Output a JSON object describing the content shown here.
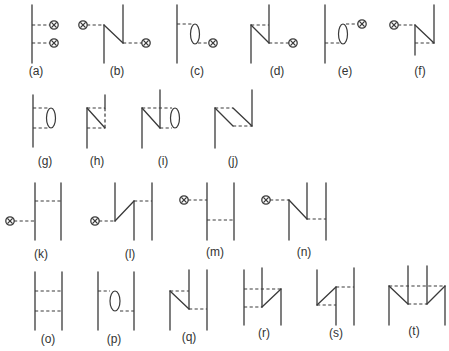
{
  "figure": {
    "diagrams": [
      {
        "id": "a",
        "label": "(a)",
        "lx": 36,
        "ly": 75,
        "solid": [
          [
            32,
            5,
            32,
            63
          ]
        ],
        "dash": [
          [
            32,
            25,
            50,
            25
          ],
          [
            32,
            43,
            50,
            43
          ]
        ],
        "loops": [],
        "crosses": [
          [
            54,
            25
          ],
          [
            54,
            43
          ]
        ]
      },
      {
        "id": "b",
        "label": "(b)",
        "lx": 117,
        "ly": 75,
        "solid": [
          [
            104,
            25,
            104,
            63
          ],
          [
            104,
            25,
            123,
            43
          ],
          [
            123,
            5,
            123,
            43
          ]
        ],
        "dash": [
          [
            87,
            25,
            104,
            25
          ],
          [
            123,
            43,
            142,
            43
          ]
        ],
        "loops": [],
        "crosses": [
          [
            83,
            25
          ],
          [
            146,
            43
          ]
        ]
      },
      {
        "id": "c",
        "label": "(c)",
        "lx": 197,
        "ly": 75,
        "solid": [
          [
            177,
            5,
            177,
            63
          ]
        ],
        "dash": [
          [
            177,
            24,
            192,
            24
          ],
          [
            198,
            43,
            209,
            43
          ]
        ],
        "loops": [
          [
            195,
            34,
            4.5,
            10
          ]
        ],
        "crosses": [
          [
            213,
            43
          ]
        ]
      },
      {
        "id": "d",
        "label": "(d)",
        "lx": 277,
        "ly": 75,
        "solid": [
          [
            251,
            25,
            251,
            63
          ],
          [
            251,
            25,
            269,
            43
          ],
          [
            269,
            5,
            269,
            43
          ]
        ],
        "dash": [
          [
            251,
            25,
            269,
            25
          ],
          [
            269,
            43,
            289,
            43
          ]
        ],
        "loops": [],
        "crosses": [
          [
            293,
            43
          ]
        ]
      },
      {
        "id": "e",
        "label": "(e)",
        "lx": 345,
        "ly": 75,
        "solid": [
          [
            325,
            5,
            325,
            63
          ]
        ],
        "dash": [
          [
            325,
            43,
            340,
            43
          ],
          [
            346,
            24,
            358,
            24
          ]
        ],
        "loops": [
          [
            343,
            34,
            4.5,
            10
          ]
        ],
        "crosses": [
          [
            362,
            24
          ]
        ]
      },
      {
        "id": "f",
        "label": "(f)",
        "lx": 420,
        "ly": 75,
        "solid": [
          [
            415,
            25,
            415,
            55
          ],
          [
            415,
            25,
            434,
            43
          ],
          [
            434,
            5,
            434,
            43
          ]
        ],
        "dash": [
          [
            398,
            25,
            415,
            25
          ],
          [
            415,
            43,
            434,
            43
          ]
        ],
        "loops": [],
        "crosses": [
          [
            394,
            25
          ]
        ]
      },
      {
        "id": "g",
        "label": "(g)",
        "lx": 45,
        "ly": 165,
        "solid": [
          [
            33,
            95,
            33,
            147
          ]
        ],
        "dash": [
          [
            33,
            108,
            48,
            108
          ],
          [
            33,
            128,
            48,
            128
          ]
        ],
        "loops": [
          [
            51,
            118,
            4.5,
            10
          ]
        ],
        "crosses": []
      },
      {
        "id": "h",
        "label": "(h)",
        "lx": 97,
        "ly": 165,
        "solid": [
          [
            87,
            108,
            87,
            148
          ],
          [
            87,
            108,
            105,
            128
          ],
          [
            105,
            95,
            105,
            108
          ]
        ],
        "dash": [
          [
            87,
            108,
            105,
            108
          ],
          [
            87,
            128,
            105,
            128
          ],
          [
            105,
            108,
            105,
            128
          ]
        ],
        "loops": [],
        "crosses": []
      },
      {
        "id": "i",
        "label": "(i)",
        "lx": 163,
        "ly": 165,
        "solid": [
          [
            142,
            108,
            142,
            148
          ],
          [
            142,
            108,
            160,
            128
          ],
          [
            160,
            90,
            160,
            128
          ]
        ],
        "dash": [
          [
            142,
            108,
            172,
            108
          ],
          [
            160,
            128,
            172,
            128
          ]
        ],
        "loops": [
          [
            175,
            118,
            4.5,
            10
          ]
        ],
        "crosses": []
      },
      {
        "id": "j",
        "label": "(j)",
        "lx": 233,
        "ly": 165,
        "solid": [
          [
            215,
            108,
            215,
            148
          ],
          [
            215,
            108,
            233,
            126
          ],
          [
            233,
            108,
            252,
            126
          ],
          [
            252,
            90,
            252,
            126
          ]
        ],
        "dash": [
          [
            215,
            108,
            233,
            108
          ],
          [
            233,
            126,
            252,
            126
          ]
        ],
        "loops": [],
        "crosses": []
      },
      {
        "id": "k",
        "label": "(k)",
        "lx": 41,
        "ly": 258,
        "solid": [
          [
            35,
            183,
            35,
            240
          ],
          [
            61,
            183,
            61,
            240
          ]
        ],
        "dash": [
          [
            14,
            221,
            35,
            221
          ],
          [
            35,
            201,
            61,
            201
          ]
        ],
        "loops": [],
        "crosses": [
          [
            10,
            221
          ]
        ]
      },
      {
        "id": "l",
        "label": "(l)",
        "lx": 130,
        "ly": 258,
        "solid": [
          [
            115,
            183,
            115,
            221
          ],
          [
            115,
            221,
            134,
            201
          ],
          [
            134,
            201,
            134,
            240
          ],
          [
            152,
            183,
            152,
            240
          ]
        ],
        "dash": [
          [
            99,
            221,
            115,
            221
          ],
          [
            134,
            201,
            152,
            201
          ]
        ],
        "loops": [],
        "crosses": [
          [
            95,
            221
          ]
        ]
      },
      {
        "id": "m",
        "label": "(m)",
        "lx": 215,
        "ly": 256,
        "solid": [
          [
            207,
            183,
            207,
            240
          ],
          [
            234,
            183,
            234,
            240
          ]
        ],
        "dash": [
          [
            188,
            200,
            207,
            200
          ],
          [
            207,
            220,
            234,
            220
          ]
        ],
        "loops": [],
        "crosses": [
          [
            184,
            200
          ]
        ]
      },
      {
        "id": "n",
        "label": "(n)",
        "lx": 304,
        "ly": 256,
        "solid": [
          [
            289,
            200,
            289,
            240
          ],
          [
            289,
            200,
            307,
            219
          ],
          [
            307,
            183,
            307,
            219
          ],
          [
            326,
            183,
            326,
            240
          ]
        ],
        "dash": [
          [
            270,
            200,
            289,
            200
          ],
          [
            307,
            219,
            326,
            219
          ]
        ],
        "loops": [],
        "crosses": [
          [
            266,
            200
          ]
        ]
      },
      {
        "id": "o",
        "label": "(o)",
        "lx": 48,
        "ly": 343,
        "solid": [
          [
            35,
            272,
            35,
            330
          ],
          [
            62,
            272,
            62,
            330
          ]
        ],
        "dash": [
          [
            35,
            291,
            62,
            291
          ],
          [
            35,
            311,
            62,
            311
          ]
        ],
        "loops": [],
        "crosses": []
      },
      {
        "id": "p",
        "label": "(p)",
        "lx": 114,
        "ly": 343,
        "solid": [
          [
            98,
            272,
            98,
            330
          ],
          [
            134,
            272,
            134,
            330
          ]
        ],
        "dash": [
          [
            98,
            291,
            110,
            291
          ],
          [
            120,
            311,
            134,
            311
          ]
        ],
        "loops": [
          [
            115,
            301,
            5,
            10
          ]
        ],
        "crosses": []
      },
      {
        "id": "q",
        "label": "(q)",
        "lx": 189,
        "ly": 341,
        "solid": [
          [
            170,
            291,
            170,
            330
          ],
          [
            170,
            291,
            189,
            309
          ],
          [
            189,
            270,
            189,
            309
          ],
          [
            207,
            270,
            207,
            330
          ]
        ],
        "dash": [
          [
            170,
            291,
            189,
            291
          ],
          [
            189,
            309,
            207,
            309
          ]
        ],
        "loops": [],
        "crosses": []
      },
      {
        "id": "r",
        "label": "(r)",
        "lx": 264,
        "ly": 337,
        "solid": [
          [
            244,
            270,
            244,
            325
          ],
          [
            262,
            268,
            262,
            307
          ],
          [
            262,
            307,
            281,
            289
          ],
          [
            281,
            289,
            281,
            325
          ]
        ],
        "dash": [
          [
            244,
            289,
            281,
            289
          ],
          [
            244,
            307,
            262,
            307
          ]
        ],
        "loops": [],
        "crosses": []
      },
      {
        "id": "s",
        "label": "(s)",
        "lx": 336,
        "ly": 337,
        "solid": [
          [
            317,
            270,
            317,
            305
          ],
          [
            317,
            305,
            336,
            287
          ],
          [
            336,
            287,
            336,
            325
          ],
          [
            354,
            268,
            354,
            325
          ]
        ],
        "dash": [
          [
            336,
            287,
            354,
            287
          ],
          [
            317,
            305,
            336,
            305
          ]
        ],
        "loops": [],
        "crosses": []
      },
      {
        "id": "t",
        "label": "(t)",
        "lx": 414,
        "ly": 335,
        "solid": [
          [
            389,
            286,
            389,
            325
          ],
          [
            389,
            286,
            408,
            304
          ],
          [
            408,
            266,
            408,
            304
          ],
          [
            427,
            266,
            427,
            304
          ],
          [
            427,
            304,
            445,
            286
          ],
          [
            445,
            286,
            445,
            325
          ]
        ],
        "dash": [
          [
            389,
            286,
            445,
            286
          ],
          [
            408,
            304,
            427,
            304
          ]
        ],
        "loops": [],
        "crosses": []
      }
    ]
  }
}
